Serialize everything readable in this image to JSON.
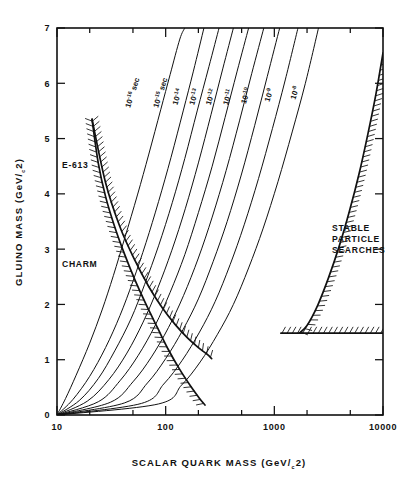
{
  "figure": {
    "name": "gluino-mass-vs-scalar-quark-mass-exclusion-plot",
    "background": "#ffffff",
    "ink_color": "#111111"
  },
  "axes": {
    "x": {
      "title": "SCALAR QUARK MASS (GeV/c2)",
      "title_main": "SCALAR QUARK MASS (GeV/",
      "title_sub": "c",
      "title_tail": "2)",
      "scale": "log",
      "min": 10,
      "max": 10000,
      "major_ticks": [
        10,
        100,
        1000,
        10000
      ],
      "major_tick_labels": [
        "10",
        "100",
        "1000",
        "10000"
      ],
      "minor_ticks": [
        20,
        50,
        200,
        500,
        2000,
        5000
      ]
    },
    "y": {
      "title": "GLUINO MASS (GeV/c2)",
      "title_main": "GLUINO MASS (GeV/",
      "title_sub": "c",
      "title_tail": "2)",
      "scale": "linear",
      "min": 0,
      "max": 7,
      "major_ticks": [
        0,
        1,
        2,
        3,
        4,
        5,
        6,
        7
      ],
      "major_tick_labels": [
        "0",
        "1",
        "2",
        "3",
        "4",
        "5",
        "6",
        "7"
      ]
    }
  },
  "chart_data": {
    "type": "line",
    "title": "",
    "xlabel": "SCALAR QUARK MASS (GeV/c2)",
    "ylabel": "GLUINO MASS (GeV/c2)",
    "xscale": "log",
    "yscale": "linear",
    "xlim": [
      10,
      10000
    ],
    "ylim": [
      0,
      7
    ],
    "grid": false,
    "legend": "none",
    "series": [
      {
        "name": "10^-16 sec",
        "label": "10",
        "label_exponent": "-16",
        "label_units": "sec",
        "kind": "lifetime-contour",
        "label_x": 47,
        "label_y": 5.55,
        "points": [
          {
            "x": 10,
            "y": 0.0
          },
          {
            "x": 12,
            "y": 0.3
          },
          {
            "x": 15,
            "y": 0.72
          },
          {
            "x": 20,
            "y": 1.3
          },
          {
            "x": 26,
            "y": 1.9
          },
          {
            "x": 33,
            "y": 2.52
          },
          {
            "x": 42,
            "y": 3.2
          },
          {
            "x": 55,
            "y": 3.98
          },
          {
            "x": 70,
            "y": 4.72
          },
          {
            "x": 90,
            "y": 5.52
          },
          {
            "x": 110,
            "y": 6.16
          },
          {
            "x": 135,
            "y": 6.8
          },
          {
            "x": 150,
            "y": 7.0
          }
        ]
      },
      {
        "name": "10^-15 sec",
        "label": "10",
        "label_exponent": "-15",
        "label_units": "sec",
        "kind": "lifetime-contour",
        "label_x": 85,
        "label_y": 5.55,
        "points": [
          {
            "x": 10,
            "y": 0.0
          },
          {
            "x": 14,
            "y": 0.28
          },
          {
            "x": 20,
            "y": 0.7
          },
          {
            "x": 28,
            "y": 1.22
          },
          {
            "x": 38,
            "y": 1.8
          },
          {
            "x": 50,
            "y": 2.42
          },
          {
            "x": 66,
            "y": 3.12
          },
          {
            "x": 86,
            "y": 3.86
          },
          {
            "x": 112,
            "y": 4.66
          },
          {
            "x": 145,
            "y": 5.5
          },
          {
            "x": 180,
            "y": 6.22
          },
          {
            "x": 225,
            "y": 7.0
          }
        ]
      },
      {
        "name": "10^-14 sec",
        "label": "10",
        "label_exponent": "-14",
        "label_units": "",
        "kind": "lifetime-contour",
        "label_x": 128,
        "label_y": 5.6,
        "points": [
          {
            "x": 10,
            "y": 0.0
          },
          {
            "x": 16,
            "y": 0.26
          },
          {
            "x": 24,
            "y": 0.66
          },
          {
            "x": 34,
            "y": 1.16
          },
          {
            "x": 48,
            "y": 1.74
          },
          {
            "x": 64,
            "y": 2.36
          },
          {
            "x": 86,
            "y": 3.06
          },
          {
            "x": 115,
            "y": 3.84
          },
          {
            "x": 150,
            "y": 4.64
          },
          {
            "x": 195,
            "y": 5.5
          },
          {
            "x": 250,
            "y": 6.3
          },
          {
            "x": 310,
            "y": 7.0
          }
        ]
      },
      {
        "name": "10^-13 sec",
        "label": "10",
        "label_exponent": "-13",
        "label_units": "",
        "kind": "lifetime-contour",
        "label_x": 182,
        "label_y": 5.6,
        "points": [
          {
            "x": 10,
            "y": 0.0
          },
          {
            "x": 19,
            "y": 0.25
          },
          {
            "x": 30,
            "y": 0.64
          },
          {
            "x": 44,
            "y": 1.12
          },
          {
            "x": 62,
            "y": 1.68
          },
          {
            "x": 84,
            "y": 2.28
          },
          {
            "x": 114,
            "y": 2.98
          },
          {
            "x": 152,
            "y": 3.74
          },
          {
            "x": 200,
            "y": 4.56
          },
          {
            "x": 262,
            "y": 5.44
          },
          {
            "x": 335,
            "y": 6.26
          },
          {
            "x": 420,
            "y": 7.0
          }
        ]
      },
      {
        "name": "10^-12 sec",
        "label": "10",
        "label_exponent": "-12",
        "label_units": "",
        "kind": "lifetime-contour",
        "label_x": 258,
        "label_y": 5.6,
        "points": [
          {
            "x": 10,
            "y": 0.0
          },
          {
            "x": 24,
            "y": 0.24
          },
          {
            "x": 38,
            "y": 0.62
          },
          {
            "x": 56,
            "y": 1.08
          },
          {
            "x": 80,
            "y": 1.62
          },
          {
            "x": 110,
            "y": 2.22
          },
          {
            "x": 150,
            "y": 2.9
          },
          {
            "x": 200,
            "y": 3.66
          },
          {
            "x": 268,
            "y": 4.5
          },
          {
            "x": 352,
            "y": 5.38
          },
          {
            "x": 455,
            "y": 6.22
          },
          {
            "x": 580,
            "y": 7.0
          }
        ]
      },
      {
        "name": "10^-11 sec",
        "label": "10",
        "label_exponent": "-11",
        "label_units": "",
        "kind": "lifetime-contour",
        "label_x": 372,
        "label_y": 5.6,
        "points": [
          {
            "x": 10,
            "y": 0.0
          },
          {
            "x": 31,
            "y": 0.23
          },
          {
            "x": 50,
            "y": 0.6
          },
          {
            "x": 74,
            "y": 1.05
          },
          {
            "x": 106,
            "y": 1.58
          },
          {
            "x": 146,
            "y": 2.16
          },
          {
            "x": 200,
            "y": 2.84
          },
          {
            "x": 268,
            "y": 3.58
          },
          {
            "x": 360,
            "y": 4.42
          },
          {
            "x": 478,
            "y": 5.32
          },
          {
            "x": 620,
            "y": 6.18
          },
          {
            "x": 800,
            "y": 7.0
          }
        ]
      },
      {
        "name": "10^-10 sec",
        "label": "10",
        "label_exponent": "-10",
        "label_units": "",
        "kind": "lifetime-contour",
        "label_x": 545,
        "label_y": 5.62,
        "points": [
          {
            "x": 10,
            "y": 0.0
          },
          {
            "x": 42,
            "y": 0.22
          },
          {
            "x": 68,
            "y": 0.58
          },
          {
            "x": 100,
            "y": 1.02
          },
          {
            "x": 144,
            "y": 1.54
          },
          {
            "x": 200,
            "y": 2.1
          },
          {
            "x": 274,
            "y": 2.78
          },
          {
            "x": 368,
            "y": 3.5
          },
          {
            "x": 496,
            "y": 4.34
          },
          {
            "x": 660,
            "y": 5.24
          },
          {
            "x": 860,
            "y": 6.12
          },
          {
            "x": 1120,
            "y": 7.0
          }
        ]
      },
      {
        "name": "10^-9 sec",
        "label": "10",
        "label_exponent": "-9",
        "label_units": "",
        "kind": "lifetime-contour",
        "label_x": 900,
        "label_y": 5.66,
        "points": [
          {
            "x": 10,
            "y": 0.0
          },
          {
            "x": 60,
            "y": 0.21
          },
          {
            "x": 96,
            "y": 0.56
          },
          {
            "x": 142,
            "y": 0.99
          },
          {
            "x": 205,
            "y": 1.5
          },
          {
            "x": 285,
            "y": 2.05
          },
          {
            "x": 392,
            "y": 2.72
          },
          {
            "x": 528,
            "y": 3.44
          },
          {
            "x": 716,
            "y": 4.28
          },
          {
            "x": 960,
            "y": 5.18
          },
          {
            "x": 1260,
            "y": 6.06
          },
          {
            "x": 1650,
            "y": 7.0
          }
        ]
      },
      {
        "name": "10^-8 sec",
        "label": "10",
        "label_exponent": "-8",
        "label_units": "",
        "kind": "lifetime-contour",
        "label_x": 1560,
        "label_y": 5.7,
        "points": [
          {
            "x": 10,
            "y": 0.0
          },
          {
            "x": 86,
            "y": 0.2
          },
          {
            "x": 140,
            "y": 0.54
          },
          {
            "x": 208,
            "y": 0.96
          },
          {
            "x": 300,
            "y": 1.46
          },
          {
            "x": 420,
            "y": 2.0
          },
          {
            "x": 580,
            "y": 2.66
          },
          {
            "x": 790,
            "y": 3.38
          },
          {
            "x": 1080,
            "y": 4.22
          },
          {
            "x": 1460,
            "y": 5.12
          },
          {
            "x": 1930,
            "y": 6.0
          },
          {
            "x": 2550,
            "y": 7.0
          }
        ]
      }
    ],
    "exclusion_regions": [
      {
        "name": "E-613",
        "label": "E-613",
        "label_x": 12.6,
        "label_y": 4.8,
        "hatch_side": "left",
        "boundary": [
          {
            "x": 21,
            "y": 5.35
          },
          {
            "x": 24,
            "y": 4.55
          },
          {
            "x": 28,
            "y": 3.95
          },
          {
            "x": 34,
            "y": 3.4
          },
          {
            "x": 42,
            "y": 2.9
          },
          {
            "x": 52,
            "y": 2.45
          },
          {
            "x": 66,
            "y": 2.0
          },
          {
            "x": 84,
            "y": 1.58
          },
          {
            "x": 106,
            "y": 1.18
          },
          {
            "x": 135,
            "y": 0.82
          },
          {
            "x": 170,
            "y": 0.52
          },
          {
            "x": 205,
            "y": 0.3
          },
          {
            "x": 230,
            "y": 0.18
          }
        ]
      },
      {
        "name": "CHARM",
        "label": "CHARM",
        "label_x": 12.6,
        "label_y": 2.85,
        "hatch_side": "right",
        "boundary": [
          {
            "x": 21,
            "y": 5.35
          },
          {
            "x": 28,
            "y": 4.2
          },
          {
            "x": 38,
            "y": 3.4
          },
          {
            "x": 52,
            "y": 2.8
          },
          {
            "x": 70,
            "y": 2.32
          },
          {
            "x": 93,
            "y": 1.94
          },
          {
            "x": 122,
            "y": 1.64
          },
          {
            "x": 158,
            "y": 1.4
          },
          {
            "x": 200,
            "y": 1.22
          },
          {
            "x": 240,
            "y": 1.1
          },
          {
            "x": 265,
            "y": 1.02
          }
        ]
      },
      {
        "name": "STABLE PARTICLE SEARCHES",
        "label": "STABLE PARTICLE SEARCHES",
        "label_lines": [
          "STABLE",
          "PARTICLE",
          "SEARCHES"
        ],
        "label_x": 2100,
        "label_y": 3.35,
        "hatch_side": "right",
        "boundary": [
          {
            "x": 10000,
            "y": 6.55
          },
          {
            "x": 8600,
            "y": 5.8
          },
          {
            "x": 7200,
            "y": 5.05
          },
          {
            "x": 6000,
            "y": 4.35
          },
          {
            "x": 4900,
            "y": 3.68
          },
          {
            "x": 3950,
            "y": 3.05
          },
          {
            "x": 3150,
            "y": 2.48
          },
          {
            "x": 2500,
            "y": 1.98
          },
          {
            "x": 2000,
            "y": 1.62
          },
          {
            "x": 1700,
            "y": 1.48
          }
        ],
        "horizontal_boundary": {
          "y": 1.48,
          "x_start": 1150,
          "x_end": 10000
        }
      }
    ]
  },
  "annotations": {
    "e613": "E-613",
    "charm": "CHARM",
    "stable_line1": "STABLE",
    "stable_line2": "PARTICLE",
    "stable_line3": "SEARCHES"
  }
}
